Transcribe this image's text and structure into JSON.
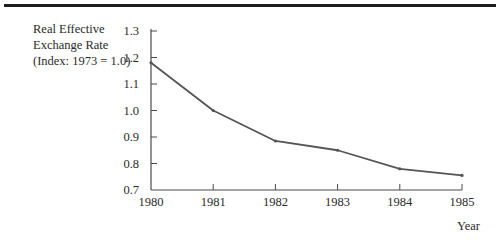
{
  "chart_data": {
    "type": "line",
    "title": "",
    "ylabel_lines": [
      "Real Effective",
      "Exchange Rate",
      "(Index: 1973 = 1.0)"
    ],
    "xlabel": "Year",
    "x": [
      1980,
      1981,
      1982,
      1983,
      1984,
      1985
    ],
    "series": [
      {
        "name": "Real Effective Exchange Rate",
        "values": [
          1.18,
          1.0,
          0.885,
          0.85,
          0.78,
          0.755
        ],
        "color": "#555555"
      }
    ],
    "xticks": [
      "1980",
      "1981",
      "1982",
      "1983",
      "1984",
      "1985"
    ],
    "yticks": [
      "0.7",
      "0.8",
      "0.9",
      "1.0",
      "1.1",
      "1.2",
      "1.3"
    ],
    "ylim": [
      0.7,
      1.3
    ],
    "xlim": [
      1980,
      1985
    ],
    "grid": false,
    "legend": "none"
  }
}
